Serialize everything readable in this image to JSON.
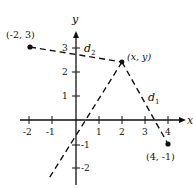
{
  "figure": {
    "axes": {
      "x_label": "x",
      "y_label": "y",
      "x_ticks": [
        "-2",
        "-1",
        "1",
        "2",
        "3",
        "4"
      ],
      "y_ticks": [
        "3",
        "2",
        "1",
        "-1",
        "-2"
      ]
    },
    "points": [
      {
        "label": "(-2, 3)",
        "x": -2,
        "y": 3
      },
      {
        "label": "(x, y)",
        "x": 2,
        "y": 2.6
      },
      {
        "label": "(4, -1)",
        "x": 4,
        "y": -1
      }
    ],
    "segments": [
      {
        "label": "d",
        "sub": "2",
        "from": "(-2, 3)",
        "to": "(x, y)"
      },
      {
        "label": "d",
        "sub": "1",
        "from": "(x, y)",
        "to": "(4, -1)"
      }
    ],
    "bisector_line": "dashed line through (x, y) perpendicular-bisecting"
  }
}
